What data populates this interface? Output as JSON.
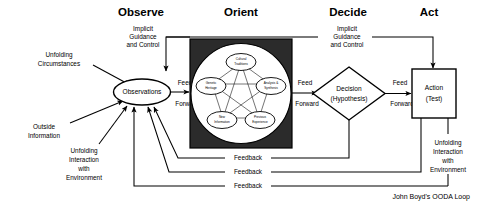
{
  "diagram": {
    "title": "John Boyd's OODA Loop",
    "caption": "John Boyd's OODA Loop",
    "phases": [
      {
        "id": "observe",
        "label": "Observe"
      },
      {
        "id": "orient",
        "label": "Orient"
      },
      {
        "id": "decide",
        "label": "Decide"
      },
      {
        "id": "act",
        "label": "Act"
      }
    ],
    "inputs": [
      {
        "id": "unfolding-circumstances",
        "lines": [
          "Unfolding",
          "Circumstances"
        ]
      },
      {
        "id": "outside-information",
        "lines": [
          "Outside",
          "Information"
        ]
      },
      {
        "id": "unfolding-interaction-environment",
        "lines": [
          "Unfolding",
          "Interaction",
          "with",
          "Environment"
        ]
      }
    ],
    "implicit_guidance_left": {
      "lines": [
        "Implicit",
        "Guidance",
        "and Control"
      ]
    },
    "implicit_guidance_right": {
      "lines": [
        "Implicit",
        "Guidance",
        "and Control"
      ]
    },
    "nodes": {
      "observations": {
        "lines": [
          "Observations"
        ]
      },
      "decision": {
        "lines": [
          "Decision",
          "(Hypothesis)"
        ]
      },
      "action": {
        "lines": [
          "Action",
          "(Test)"
        ]
      }
    },
    "orient_nodes": [
      {
        "id": "cultural-traditions",
        "lines": [
          "Cultural",
          "Traditions"
        ]
      },
      {
        "id": "genetic-heritage",
        "lines": [
          "Genetic",
          "Heritage"
        ]
      },
      {
        "id": "analysis-synthesis",
        "lines": [
          "Analysis &",
          "Synthesis"
        ]
      },
      {
        "id": "new-information",
        "lines": [
          "New",
          "Information"
        ]
      },
      {
        "id": "previous-experience",
        "lines": [
          "Previous",
          "Experience"
        ]
      }
    ],
    "feed_forward_labels": [
      {
        "id": "ff-observe-orient",
        "top": "Feed",
        "bottom": "Forward"
      },
      {
        "id": "ff-orient-decide",
        "top": "Feed",
        "bottom": "Forward"
      },
      {
        "id": "ff-decide-act",
        "top": "Feed",
        "bottom": "Forward"
      }
    ],
    "feedback_labels": [
      {
        "id": "feedback-from-decide",
        "label": "Feedback"
      },
      {
        "id": "feedback-from-act",
        "label": "Feedback"
      },
      {
        "id": "feedback-from-environment",
        "label": "Feedback"
      }
    ],
    "output": {
      "id": "unfolding-interaction-act",
      "lines": [
        "Unfolding",
        "Interaction",
        "with",
        "Environment"
      ]
    },
    "colors": {
      "background": "#ffffff",
      "ink": "#000000",
      "orient_panel": "#2b2b2b"
    }
  }
}
